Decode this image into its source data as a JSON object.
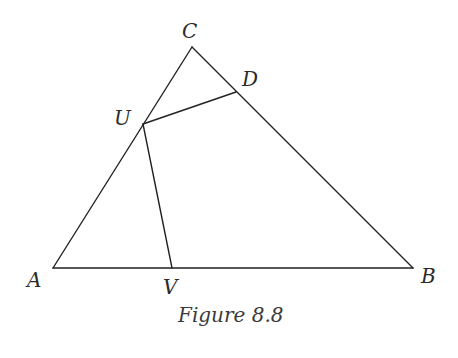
{
  "figure": {
    "caption": "Figure 8.8",
    "stroke_color": "#222222",
    "label_color": "#2a2a2a",
    "points": {
      "A": {
        "label": "A",
        "x": 53,
        "y": 268
      },
      "B": {
        "label": "B",
        "x": 413,
        "y": 268
      },
      "C": {
        "label": "C",
        "x": 192,
        "y": 47
      },
      "D": {
        "label": "D",
        "x": 236,
        "y": 92
      },
      "U": {
        "label": "U",
        "x": 143,
        "y": 124
      },
      "V": {
        "label": "V",
        "x": 172,
        "y": 268
      }
    },
    "segments": [
      {
        "from": "A",
        "to": "B"
      },
      {
        "from": "B",
        "to": "C"
      },
      {
        "from": "C",
        "to": "A"
      },
      {
        "from": "U",
        "to": "D"
      },
      {
        "from": "U",
        "to": "V"
      }
    ]
  }
}
